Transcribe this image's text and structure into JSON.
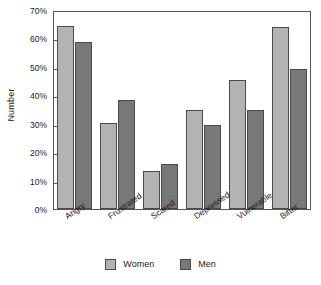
{
  "chart_data": {
    "type": "bar",
    "title": "",
    "xlabel": "",
    "ylabel": "Number",
    "categories": [
      "Angry",
      "Frustrated",
      "Scared",
      "Depressed",
      "Vulnerable",
      "Bitter"
    ],
    "series": [
      {
        "name": "Women",
        "color": "#b3b3b3",
        "values": [
          64.3,
          30.2,
          13.3,
          35.0,
          45.3,
          64.0
        ]
      },
      {
        "name": "Men",
        "color": "#787878",
        "values": [
          58.6,
          38.3,
          16.0,
          29.4,
          34.7,
          49.3
        ]
      }
    ],
    "ylim": [
      0,
      70
    ],
    "ytick_values": [
      0,
      10,
      20,
      30,
      40,
      50,
      60,
      70
    ],
    "ytick_labels": [
      "0%",
      "10%",
      "20%",
      "30%",
      "40%",
      "50%",
      "60%",
      "70%"
    ],
    "grid": false,
    "legend_position": "bottom",
    "value_unit": "%"
  },
  "legend": {
    "items": [
      {
        "label": "Women"
      },
      {
        "label": "Men"
      }
    ]
  }
}
